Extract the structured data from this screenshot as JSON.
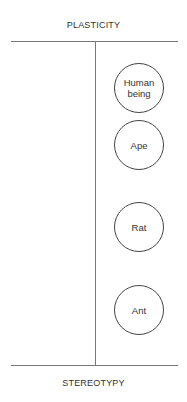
{
  "diagram": {
    "top_label": "PLASTICITY",
    "bottom_label": "STEREOTYPY",
    "nodes": [
      {
        "label": "Human being",
        "line1": "Human",
        "line2": "being"
      },
      {
        "label": "Ape"
      },
      {
        "label": "Rat"
      },
      {
        "label": "Ant"
      }
    ]
  }
}
